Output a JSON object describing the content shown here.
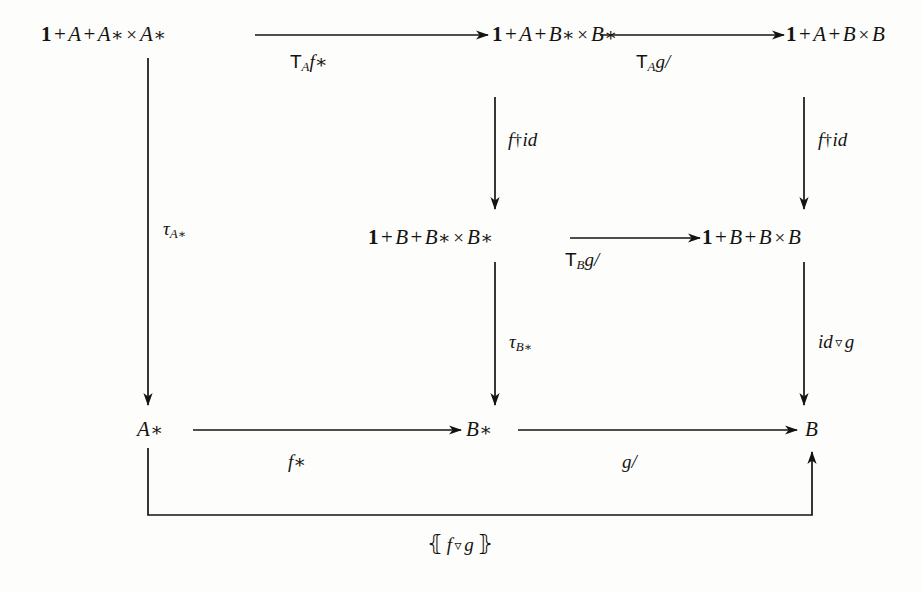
{
  "diagram": {
    "kind": "commutative-diagram",
    "title": "",
    "background_color": "#fdfdfc",
    "ink_color": "#15130f",
    "nodes": [
      {
        "id": "tl",
        "label": "1 + A + A* × A*",
        "row": "top",
        "col": "left",
        "x": 145,
        "y": 35
      },
      {
        "id": "tm",
        "label": "1 + A + B* × B*",
        "row": "top",
        "col": "middle",
        "x": 495,
        "y": 35
      },
      {
        "id": "tr",
        "label": "1 + A + B × B",
        "row": "top",
        "col": "right",
        "x": 788,
        "y": 35
      },
      {
        "id": "mm",
        "label": "1 + B + B* × B*",
        "row": "middle",
        "col": "middle",
        "x": 467,
        "y": 238
      },
      {
        "id": "mr",
        "label": "1 + B + B × B",
        "row": "middle",
        "col": "right",
        "x": 788,
        "y": 238
      },
      {
        "id": "bl",
        "label": "A*",
        "row": "bottom",
        "col": "left",
        "x": 147,
        "y": 430
      },
      {
        "id": "bm",
        "label": "B*",
        "row": "bottom",
        "col": "middle",
        "x": 477,
        "y": 430
      },
      {
        "id": "br",
        "label": "B",
        "row": "bottom",
        "col": "right",
        "x": 810,
        "y": 430
      }
    ],
    "arrows": [
      {
        "id": "a1",
        "from": "tl",
        "to": "tm",
        "direction": "right",
        "label": "T_A f*",
        "label_text": "T",
        "label_sub": "A",
        "label_tail": "f*"
      },
      {
        "id": "a2",
        "from": "tm",
        "to": "tr",
        "direction": "right",
        "label": "T_A g/",
        "label_text": "T",
        "label_sub": "A",
        "label_tail": "g/"
      },
      {
        "id": "a3",
        "from": "tm",
        "to": "mm",
        "direction": "down",
        "label": "f†id"
      },
      {
        "id": "a4",
        "from": "tr",
        "to": "mr",
        "direction": "down",
        "label": "f†id"
      },
      {
        "id": "a5",
        "from": "mm",
        "to": "mr",
        "direction": "right",
        "label": "T_B g/",
        "label_text": "T",
        "label_sub": "B",
        "label_tail": "g/"
      },
      {
        "id": "a6",
        "from": "tl",
        "to": "bl",
        "direction": "down",
        "label": "τ_A*"
      },
      {
        "id": "a7",
        "from": "mm",
        "to": "bm",
        "direction": "down",
        "label": "τ_B*"
      },
      {
        "id": "a8",
        "from": "mr",
        "to": "br",
        "direction": "down",
        "label": "id ▽ g"
      },
      {
        "id": "a9",
        "from": "bl",
        "to": "bm",
        "direction": "right",
        "label": "f*"
      },
      {
        "id": "a10",
        "from": "bm",
        "to": "br",
        "direction": "right",
        "label": "g/"
      },
      {
        "id": "a11",
        "from": "bl",
        "to": "br",
        "direction": "up-right-elbow",
        "label": "⦃f ▽ g⦄"
      }
    ],
    "arrow_labels": {
      "top_left": {
        "head": "T",
        "sub": "A",
        "tail": "f*",
        "x": 310,
        "y": 62
      },
      "top_right": {
        "head": "T",
        "sub": "A",
        "tail": "g/",
        "x": 648,
        "y": 62
      },
      "mid_right": {
        "head": "T",
        "sub": "B",
        "tail": "g/",
        "x": 577,
        "y": 258
      },
      "vert_mid_top": {
        "text": "f†id",
        "x": 509,
        "y": 140
      },
      "vert_right_top": {
        "text": "f†id",
        "x": 818,
        "y": 140
      },
      "vert_left": {
        "tau": "τ",
        "sub": "A*",
        "x": 165,
        "y": 228
      },
      "vert_mid_bot": {
        "tau": "τ",
        "sub": "B*",
        "x": 509,
        "y": 340
      },
      "vert_right_bot": {
        "text": "id ▽ g",
        "x": 818,
        "y": 340
      },
      "bottom_left": {
        "text": "f*",
        "x": 295,
        "y": 462
      },
      "bottom_right": {
        "text": "g/",
        "x": 625,
        "y": 462
      },
      "bottom_banana": {
        "open": "⦃",
        "body": "f ▽ g",
        "close": "⦄",
        "x": 440,
        "y": 543
      }
    }
  }
}
